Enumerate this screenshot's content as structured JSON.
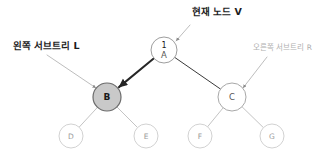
{
  "canvas": {
    "width": 333,
    "height": 160,
    "background": "#ffffff"
  },
  "diagram": {
    "type": "binary-tree",
    "title_visible": false
  },
  "colors": {
    "highlight_fill": "#c9c9c9",
    "highlight_stroke": "#6b6b6b",
    "plain_stroke": "#b9b9b9",
    "leaf_stroke": "#d2d2d2",
    "edge_dark": "#262626",
    "edge_light": "#c4c4c4",
    "leader_line": "#b5b5b5",
    "text_dark": "#1c1c1c",
    "text_faint": "#b0b0b0"
  },
  "nodes": [
    {
      "id": "A",
      "label": "A",
      "index_label": "1",
      "cx": 164,
      "cy": 50,
      "r": 13,
      "fill": "#ffffff",
      "stroke": "#9e9e9e",
      "stroke_width": 1,
      "label_style": "mid",
      "role": "root-current-node"
    },
    {
      "id": "B",
      "label": "B",
      "index_label": "",
      "cx": 107,
      "cy": 97,
      "r": 14,
      "fill": "#c9c9c9",
      "stroke": "#6b6b6b",
      "stroke_width": 1.2,
      "label_style": "dark",
      "role": "left-subtree-root"
    },
    {
      "id": "C",
      "label": "C",
      "index_label": "",
      "cx": 232,
      "cy": 97,
      "r": 14,
      "fill": "#ffffff",
      "stroke": "#a8a8a8",
      "stroke_width": 1,
      "label_style": "mid",
      "role": "right-subtree-root"
    },
    {
      "id": "D",
      "label": "D",
      "index_label": "",
      "cx": 71,
      "cy": 136,
      "r": 12,
      "fill": "#ffffff",
      "stroke": "#d2d2d2",
      "stroke_width": 1,
      "label_style": "light",
      "role": "leaf"
    },
    {
      "id": "E",
      "label": "E",
      "index_label": "",
      "cx": 146,
      "cy": 136,
      "r": 12,
      "fill": "#ffffff",
      "stroke": "#d2d2d2",
      "stroke_width": 1,
      "label_style": "light",
      "role": "leaf"
    },
    {
      "id": "F",
      "label": "F",
      "index_label": "",
      "cx": 200,
      "cy": 136,
      "r": 12,
      "fill": "#ffffff",
      "stroke": "#d2d2d2",
      "stroke_width": 1,
      "label_style": "light",
      "role": "leaf"
    },
    {
      "id": "G",
      "label": "G",
      "index_label": "",
      "cx": 272,
      "cy": 136,
      "r": 12,
      "fill": "#ffffff",
      "stroke": "#d2d2d2",
      "stroke_width": 1,
      "label_style": "light",
      "role": "leaf"
    }
  ],
  "edges": [
    {
      "from": "A",
      "to": "B",
      "style": "thick-arrow",
      "stroke": "#262626",
      "width": 2.0,
      "arrow": true
    },
    {
      "from": "A",
      "to": "C",
      "style": "thin",
      "stroke": "#3a3a3a",
      "width": 1.0,
      "arrow": false
    },
    {
      "from": "B",
      "to": "D",
      "style": "thin",
      "stroke": "#c4c4c4",
      "width": 1.0,
      "arrow": false
    },
    {
      "from": "B",
      "to": "E",
      "style": "thin",
      "stroke": "#c4c4c4",
      "width": 1.0,
      "arrow": false
    },
    {
      "from": "C",
      "to": "F",
      "style": "thin",
      "stroke": "#c4c4c4",
      "width": 1.0,
      "arrow": false
    },
    {
      "from": "C",
      "to": "G",
      "style": "thin",
      "stroke": "#c4c4c4",
      "width": 1.0,
      "arrow": false
    }
  ],
  "annotations": [
    {
      "id": "current-node",
      "text": "현재 노드 V",
      "emphasis": "strong",
      "text_left": 192,
      "text_top": 7,
      "leader": {
        "x1": 190,
        "y1": 25,
        "x2": 176,
        "y2": 41,
        "arrow": true
      },
      "target": "A"
    },
    {
      "id": "left-subtree",
      "text": "왼쪽 서브트리 L",
      "emphasis": "strong",
      "text_left": 13,
      "text_top": 41,
      "leader": {
        "x1": 47,
        "y1": 55,
        "x2": 96,
        "y2": 88,
        "arrow": true
      },
      "target": "B"
    },
    {
      "id": "right-subtree",
      "text": "오른쪽 서브트리 R",
      "emphasis": "faint",
      "text_left": 253,
      "text_top": 44,
      "leader": {
        "x1": 267,
        "y1": 57,
        "x2": 243,
        "y2": 88,
        "arrow": true
      },
      "target": "C"
    }
  ]
}
